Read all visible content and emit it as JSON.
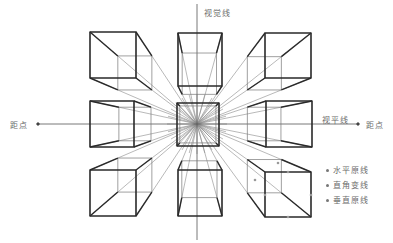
{
  "diagram": {
    "labels": {
      "vertical_line": "视觉线",
      "horizon_line": "视平线",
      "distance_point_left": "距点",
      "distance_point_right": "距点"
    },
    "legend": [
      {
        "label": "水平原线",
        "marker": "dot"
      },
      {
        "label": "直角变线",
        "marker": "dot"
      },
      {
        "label": "垂直原线",
        "marker": "dot"
      }
    ],
    "colors": {
      "cube_edge": "#2a2a2a",
      "construction_line": "#8a8a8a",
      "label_text": "#6b6b6b"
    },
    "cube_count": 9,
    "cubes": [
      {
        "id": "top-left",
        "position": "top-left"
      },
      {
        "id": "top-center",
        "position": "top-center"
      },
      {
        "id": "top-right",
        "position": "top-right"
      },
      {
        "id": "middle-left",
        "position": "middle-left"
      },
      {
        "id": "center",
        "position": "center"
      },
      {
        "id": "middle-right",
        "position": "middle-right"
      },
      {
        "id": "bottom-left",
        "position": "bottom-left"
      },
      {
        "id": "bottom-center",
        "position": "bottom-center"
      },
      {
        "id": "bottom-right",
        "position": "bottom-right"
      }
    ]
  }
}
